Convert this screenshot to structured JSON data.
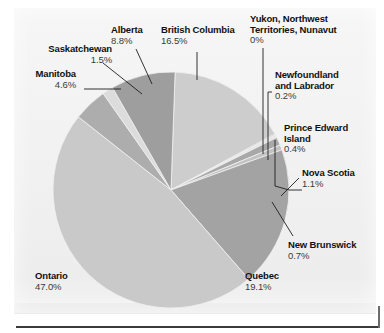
{
  "figure": {
    "background_color": "#f3f3f3",
    "page_color": "#ffffff"
  },
  "chart_data": {
    "type": "pie",
    "title": "",
    "subtitle": "",
    "xlabel": "",
    "ylabel": "",
    "legend_position": "callout-labels",
    "grid": false,
    "total": 100,
    "unit": "%",
    "start_angle_deg": -88,
    "direction": "clockwise",
    "categories": [
      "British Columbia",
      "Yukon, Northwest Territories, Nunavut",
      "Newfoundland and Labrador",
      "Prince Edward Island",
      "Nova Scotia",
      "New Brunswick",
      "Quebec",
      "Ontario",
      "Manitoba",
      "Saskatchewan",
      "Alberta"
    ],
    "values": [
      16.5,
      0.0,
      0.2,
      0.4,
      1.1,
      0.7,
      19.1,
      47.0,
      4.6,
      1.5,
      8.8
    ],
    "labels": [
      "16.5%",
      "0%",
      "0.2%",
      "0.4%",
      "1.1%",
      "0.7%",
      "19.1%",
      "47.0%",
      "4.6%",
      "1.5%",
      "8.8%"
    ],
    "colors": [
      "#cdcdcd",
      "#a5a5a5",
      "#cfcfcf",
      "#e6e6e6",
      "#a8a8a8",
      "#c2c2c2",
      "#a3a3a3",
      "#c9c9c9",
      "#adadad",
      "#dcdcdc",
      "#9e9e9e"
    ],
    "slices": [
      {
        "name": "British Columbia",
        "value": 16.5,
        "label": "16.5%",
        "color": "#cdcdcd"
      },
      {
        "name": "Yukon, Northwest Territories, Nunavut",
        "value": 0.0,
        "label": "0%",
        "color": "#a5a5a5"
      },
      {
        "name": "Newfoundland and Labrador",
        "value": 0.2,
        "label": "0.2%",
        "color": "#cfcfcf"
      },
      {
        "name": "Prince Edward Island",
        "value": 0.4,
        "label": "0.4%",
        "color": "#e6e6e6"
      },
      {
        "name": "Nova Scotia",
        "value": 1.1,
        "label": "1.1%",
        "color": "#a8a8a8"
      },
      {
        "name": "New Brunswick",
        "value": 0.7,
        "label": "0.7%",
        "color": "#c2c2c2"
      },
      {
        "name": "Quebec",
        "value": 19.1,
        "label": "19.1%",
        "color": "#a3a3a3"
      },
      {
        "name": "Ontario",
        "value": 47.0,
        "label": "47.0%",
        "color": "#c9c9c9"
      },
      {
        "name": "Manitoba",
        "value": 4.6,
        "label": "4.6%",
        "color": "#adadad"
      },
      {
        "name": "Saskatchewan",
        "value": 1.5,
        "label": "1.5%",
        "color": "#dcdcdc"
      },
      {
        "name": "Alberta",
        "value": 8.8,
        "label": "8.8%",
        "color": "#9e9e9e"
      }
    ]
  },
  "callouts": {
    "saskatchewan": {
      "name": "Saskatchewan",
      "pct": "1.5%"
    },
    "manitoba": {
      "name": "Manitoba",
      "pct": "4.6%"
    },
    "alberta": {
      "name": "Alberta",
      "pct": "8.8%"
    },
    "british_columbia": {
      "name": "British Columbia",
      "pct": "16.5%"
    },
    "yukon": {
      "name_line1": "Yukon, Northwest",
      "name_line2": "Territories, Nunavut",
      "pct": "0%"
    },
    "newfoundland": {
      "name_line1": "Newfoundland",
      "name_line2": "and Labrador",
      "pct": "0.2%"
    },
    "pei": {
      "name_line1": "Prince Edward",
      "name_line2": "Island",
      "pct": "0.4%"
    },
    "nova_scotia": {
      "name": "Nova Scotia",
      "pct": "1.1%"
    },
    "new_brunswick": {
      "name": "New Brunswick",
      "pct": "0.7%"
    },
    "quebec": {
      "name": "Quebec",
      "pct": "19.1%"
    },
    "ontario": {
      "name": "Ontario",
      "pct": "47.0%"
    }
  }
}
